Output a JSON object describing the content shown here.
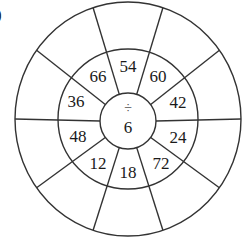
{
  "label": ")",
  "wheel": {
    "center": {
      "operator": "÷",
      "divisor": "6"
    },
    "inner_ring": [
      {
        "value": "54",
        "angle": 90
      },
      {
        "value": "60",
        "angle": 54
      },
      {
        "value": "42",
        "angle": 18
      },
      {
        "value": "24",
        "angle": -18
      },
      {
        "value": "72",
        "angle": -54
      },
      {
        "value": "18",
        "angle": -90
      },
      {
        "value": "12",
        "angle": -126
      },
      {
        "value": "48",
        "angle": -162
      },
      {
        "value": "36",
        "angle": 162
      },
      {
        "value": "66",
        "angle": 126
      }
    ],
    "outer_ring": [
      "",
      "",
      "",
      "",
      "",
      "",
      "",
      "",
      "",
      ""
    ],
    "sector_count": 10,
    "stroke_color": "#333333"
  }
}
